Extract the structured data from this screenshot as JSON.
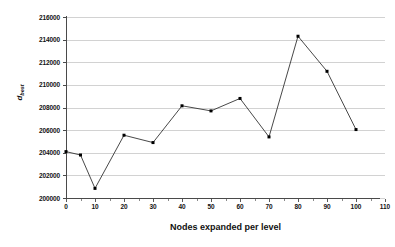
{
  "chart_data": {
    "type": "line",
    "title": "",
    "xlabel": "Nodes expanded per level",
    "ylabel": "d_best",
    "ylabel_base": "d",
    "ylabel_sub": "best",
    "xlim": [
      0,
      110
    ],
    "ylim": [
      200000,
      216000
    ],
    "grid": true,
    "legend": "none",
    "marker": "square",
    "line_color": "#333333",
    "marker_color": "#000000",
    "grid_color": "#d2d2d2",
    "axis_color": "#4a4a4a",
    "xticks": [
      0,
      10,
      20,
      30,
      40,
      50,
      60,
      70,
      80,
      90,
      100,
      110
    ],
    "xtick_labels": [
      "0",
      "10",
      "20",
      "30",
      "40",
      "50",
      "60",
      "70",
      "80",
      "90",
      "100",
      "110"
    ],
    "x_minor_step": 5,
    "yticks": [
      200000,
      202000,
      204000,
      206000,
      208000,
      210000,
      212000,
      214000,
      216000
    ],
    "ytick_labels": [
      "200000",
      "202000",
      "204000",
      "206000",
      "208000",
      "210000",
      "212000",
      "214000",
      "216000"
    ],
    "x": [
      0,
      5,
      10,
      20,
      30,
      40,
      50,
      60,
      70,
      80,
      90,
      100
    ],
    "values": [
      204100,
      203800,
      200850,
      205550,
      204900,
      208150,
      207700,
      208800,
      205400,
      214300,
      211200,
      206050
    ],
    "series": [
      {
        "name": "d_best",
        "x": [
          0,
          5,
          10,
          20,
          30,
          40,
          50,
          60,
          70,
          80,
          90,
          100
        ],
        "values": [
          204100,
          203800,
          200850,
          205550,
          204900,
          208150,
          207700,
          208800,
          205400,
          214300,
          211200,
          206050
        ]
      }
    ]
  }
}
